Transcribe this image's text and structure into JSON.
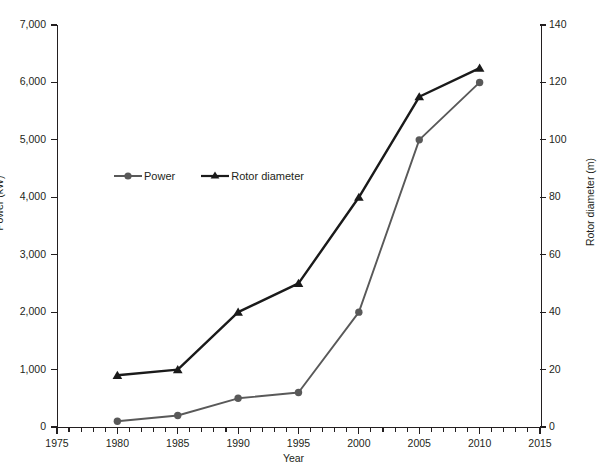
{
  "chart_data": {
    "type": "line",
    "title": "",
    "xlabel": "Year",
    "ylabel": "Power (kW)",
    "y2label": "Rotor diameter (m)",
    "xlim": [
      1975,
      2015
    ],
    "ylim": [
      0,
      7000
    ],
    "y2lim": [
      0,
      140
    ],
    "grid": false,
    "legend_position": "upper-left-inside",
    "x": [
      1980,
      1985,
      1990,
      1995,
      2000,
      2005,
      2010
    ],
    "xticks": [
      1975,
      1980,
      1985,
      1990,
      1995,
      2000,
      2005,
      2010,
      2015
    ],
    "xticklabels": [
      "1975",
      "1980",
      "1985",
      "1990",
      "1995",
      "2000",
      "2005",
      "2010",
      "2015"
    ],
    "xminor_interval": 1,
    "yticks": [
      0,
      1000,
      2000,
      3000,
      4000,
      5000,
      6000,
      7000
    ],
    "yticklabels": [
      "0",
      "1,000",
      "2,000",
      "3,000",
      "4,000",
      "5,000",
      "6,000",
      "7,000"
    ],
    "y2ticks": [
      0,
      20,
      40,
      60,
      80,
      100,
      120,
      140
    ],
    "y2ticklabels": [
      "0",
      "20",
      "40",
      "60",
      "80",
      "100",
      "120",
      "140"
    ],
    "series": [
      {
        "name": "Power",
        "axis": "left",
        "unit": "kW",
        "color": "#595959",
        "marker": "circle",
        "values": [
          100,
          200,
          500,
          600,
          2000,
          5000,
          6000
        ]
      },
      {
        "name": "Rotor diameter",
        "axis": "right",
        "unit": "m",
        "color": "#1a1a1a",
        "marker": "triangle",
        "values": [
          18,
          20,
          40,
          50,
          80,
          115,
          125
        ]
      }
    ]
  },
  "legend": {
    "items": [
      {
        "label": "Power",
        "marker": "circle-marker",
        "color": "#595959"
      },
      {
        "label": "Rotor diameter",
        "marker": "triangle-marker",
        "color": "#1a1a1a"
      }
    ]
  },
  "colors": {
    "axis": "#231f20",
    "background": "#ffffff",
    "power_series": "#595959",
    "rotor_series": "#1a1a1a"
  }
}
